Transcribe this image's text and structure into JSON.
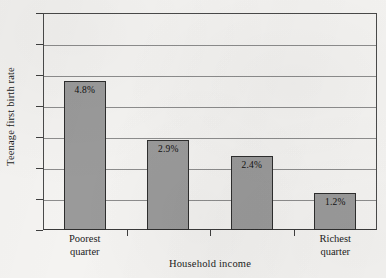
{
  "chart_data": {
    "type": "bar",
    "title": "",
    "xlabel": "Household income",
    "ylabel": "Teenage first birth rate",
    "categories": [
      "Poorest quarter",
      "",
      "",
      "Richest quarter"
    ],
    "values": [
      4.8,
      2.9,
      2.4,
      1.2
    ],
    "data_labels": [
      "4.8%",
      "2.9%",
      "2.4%",
      "1.2%"
    ],
    "ylim": [
      0,
      7
    ],
    "yticks": [
      0,
      1,
      2,
      3,
      4,
      5,
      6,
      7
    ],
    "ytick_labels": [
      "0",
      "1",
      "2",
      "3",
      "4",
      "5",
      "6",
      "7"
    ],
    "grid": true,
    "legend": "none",
    "colors": {
      "bar_fill": "#9a9a9a",
      "bar_edge": "#2e2e2e",
      "gridline": "#8d8d8d",
      "axis": "#3f3f3f",
      "background": "#f4f3f1",
      "text": "#1c1c1c"
    }
  }
}
